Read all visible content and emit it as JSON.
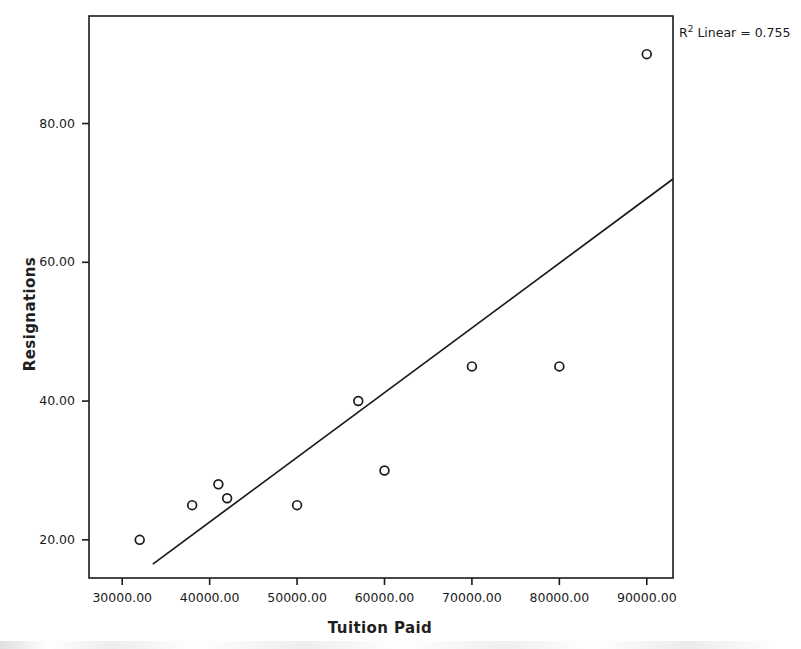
{
  "chart_data": {
    "type": "scatter",
    "title": "",
    "xlabel": "Tuition Paid",
    "ylabel": "Resignations",
    "xlim": [
      26200,
      93000
    ],
    "ylim": [
      14.5,
      95.5
    ],
    "grid": false,
    "legend": null,
    "annotations": [
      {
        "name": "r-squared",
        "prefix": "R",
        "superscript": "2",
        "text": " Linear = 0.755",
        "full_text": "R2 Linear = 0.755",
        "value": 0.755
      }
    ],
    "xticks": [
      30000,
      40000,
      50000,
      60000,
      70000,
      80000,
      90000
    ],
    "xtick_labels": [
      "30000.00",
      "40000.00",
      "50000.00",
      "60000.00",
      "70000.00",
      "80000.00",
      "90000.00"
    ],
    "yticks": [
      20,
      40,
      60,
      80
    ],
    "ytick_labels": [
      "20.00",
      "40.00",
      "60.00",
      "80.00"
    ],
    "series": [
      {
        "name": "Resignations vs Tuition Paid",
        "marker": "open-circle",
        "color": "#1a1a1a",
        "points": [
          {
            "x": 32000,
            "y": 20
          },
          {
            "x": 38000,
            "y": 25
          },
          {
            "x": 41000,
            "y": 28
          },
          {
            "x": 42000,
            "y": 26
          },
          {
            "x": 50000,
            "y": 25
          },
          {
            "x": 57000,
            "y": 40
          },
          {
            "x": 60000,
            "y": 30
          },
          {
            "x": 70000,
            "y": 45
          },
          {
            "x": 80000,
            "y": 45
          },
          {
            "x": 90000,
            "y": 90
          }
        ]
      }
    ],
    "fit_line": {
      "name": "linear-fit",
      "color": "#1a1a1a",
      "x_start": 33500,
      "y_start": 16.5,
      "x_end": 93000,
      "y_end": 72.0
    },
    "colors": {
      "frame": "#1a1a1a",
      "marker": "#1a1a1a",
      "fit_line": "#1a1a1a",
      "background": "#ffffff",
      "text": "#1a1a1a"
    }
  }
}
